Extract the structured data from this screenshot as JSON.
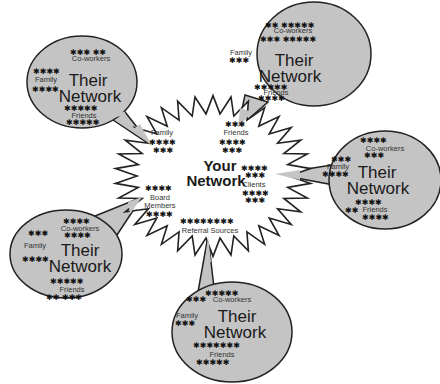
{
  "diagram": {
    "center": {
      "title_line1": "Your",
      "title_line2": "Network",
      "categories": {
        "family": "Family",
        "friends": "Friends",
        "clients": "Clients",
        "board_line1": "Board",
        "board_line2": "Members",
        "referral": "Referral Sources"
      }
    },
    "bubble_title_line1": "Their",
    "bubble_title_line2": "Network",
    "bubble_groups": {
      "coworkers": "Co-workers",
      "family": "Family",
      "friends": "Friends"
    },
    "bubbles": [
      {
        "id": "top-left",
        "linked_to": "Family"
      },
      {
        "id": "top-right",
        "linked_to": "Friends"
      },
      {
        "id": "right",
        "linked_to": "Clients"
      },
      {
        "id": "bottom-left",
        "linked_to": "Board Members"
      },
      {
        "id": "bottom",
        "linked_to": "Referral Sources"
      }
    ],
    "star_glyph": "✱",
    "colors": {
      "bubble_fill": "#c4c4c4",
      "outline": "#222222",
      "burst_fill": "#ffffff",
      "text": "#1a1a1a"
    }
  }
}
